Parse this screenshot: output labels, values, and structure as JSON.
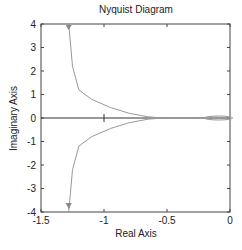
{
  "chart_data": {
    "type": "line",
    "title": "Nyquist Diagram",
    "xlabel": "Real Axis",
    "ylabel": "Imaginary Axis",
    "xlim": [
      -1.5,
      0
    ],
    "ylim": [
      -4,
      4
    ],
    "xticks": [
      "-1.5",
      "-1",
      "-0.5",
      "0"
    ],
    "yticks": [
      "4",
      "3",
      "2",
      "1",
      "0",
      "-1",
      "-2",
      "-3",
      "-4"
    ],
    "grid": false,
    "critical_point": [
      -1,
      0
    ],
    "series": [
      {
        "name": "positive frequency",
        "x": [
          -1.28,
          -1.25,
          -1.2,
          -1.1,
          -0.95,
          -0.8,
          -0.65,
          -0.58,
          -0.5,
          -0.3,
          -0.15,
          -0.05,
          0
        ],
        "y": [
          4.0,
          2.2,
          1.2,
          0.8,
          0.45,
          0.2,
          0.05,
          0.02,
          0.0,
          0.0,
          0.03,
          0.02,
          0.0
        ]
      },
      {
        "name": "negative frequency",
        "x": [
          -1.28,
          -1.25,
          -1.2,
          -1.1,
          -0.95,
          -0.8,
          -0.65,
          -0.58,
          -0.5,
          -0.3,
          -0.15,
          -0.05,
          0
        ],
        "y": [
          -4.0,
          -2.2,
          -1.2,
          -0.8,
          -0.45,
          -0.2,
          -0.05,
          -0.02,
          0.0,
          0.0,
          -0.03,
          -0.02,
          0.0
        ]
      }
    ]
  }
}
